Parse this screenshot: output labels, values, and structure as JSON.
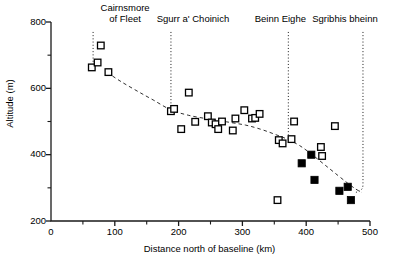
{
  "chart_data": {
    "type": "scatter",
    "title": "",
    "xlabel": "Distance north of baseline (km)",
    "ylabel": "Altitude (m)",
    "xlim": [
      0,
      500
    ],
    "ylim": [
      200,
      800
    ],
    "xticks": [
      0,
      100,
      200,
      300,
      400,
      500
    ],
    "xticklabels": [
      "0",
      "100",
      "200",
      "300",
      "400",
      "500"
    ],
    "xminor": [
      50,
      150,
      250,
      350,
      450
    ],
    "yticks": [
      200,
      400,
      600,
      800
    ],
    "yticklabels": [
      "200",
      "400",
      "600",
      "800"
    ],
    "yminor": [
      300,
      500,
      700
    ],
    "grid": false,
    "legend": "none",
    "series": [
      {
        "name": "open-squares",
        "marker": "open-square",
        "points": [
          [
            64,
            663
          ],
          [
            73,
            678
          ],
          [
            78,
            729
          ],
          [
            90,
            649
          ],
          [
            188,
            531
          ],
          [
            193,
            538
          ],
          [
            204,
            477
          ],
          [
            216,
            587
          ],
          [
            226,
            499
          ],
          [
            246,
            516
          ],
          [
            252,
            497
          ],
          [
            258,
            492
          ],
          [
            262,
            477
          ],
          [
            268,
            500
          ],
          [
            285,
            473
          ],
          [
            289,
            509
          ],
          [
            303,
            534
          ],
          [
            315,
            509
          ],
          [
            320,
            511
          ],
          [
            327,
            523
          ],
          [
            355,
            263
          ],
          [
            357,
            444
          ],
          [
            363,
            434
          ],
          [
            377,
            447
          ],
          [
            381,
            500
          ],
          [
            423,
            423
          ],
          [
            425,
            396
          ],
          [
            445,
            486
          ]
        ]
      },
      {
        "name": "filled-squares",
        "marker": "filled-square",
        "points": [
          [
            393,
            374
          ],
          [
            408,
            400
          ],
          [
            413,
            324
          ],
          [
            452,
            291
          ],
          [
            465,
            303
          ],
          [
            470,
            263
          ]
        ]
      }
    ],
    "trend_curve": {
      "name": "fitted-trend",
      "style": "dashed",
      "points": [
        [
          88,
          648
        ],
        [
          110,
          620
        ],
        [
          135,
          592
        ],
        [
          160,
          565
        ],
        [
          188,
          535
        ],
        [
          215,
          519
        ],
        [
          245,
          508
        ],
        [
          275,
          499
        ],
        [
          305,
          489
        ],
        [
          330,
          476
        ],
        [
          350,
          462
        ],
        [
          370,
          447
        ],
        [
          390,
          427
        ],
        [
          410,
          399
        ],
        [
          430,
          368
        ],
        [
          450,
          337
        ],
        [
          465,
          314
        ],
        [
          478,
          296
        ],
        [
          487,
          286
        ]
      ]
    },
    "annotations": [
      {
        "label_line1": "Cairnsmore",
        "label_line2": "of Fleet",
        "x": 66,
        "line_top": 200,
        "line_bottom": 663
      },
      {
        "label_line1": "Sgurr a' Choinich",
        "label_line2": "",
        "x": 188,
        "line_top": 200,
        "line_bottom": 532
      },
      {
        "label_line1": "Beinn Eighe",
        "label_line2": "",
        "x": 372,
        "line_top": 200,
        "line_bottom": 443
      },
      {
        "label_line1": "Sgribhis bheinn",
        "label_line2": "",
        "x": 489,
        "line_top": 200,
        "line_bottom": 290
      }
    ]
  }
}
